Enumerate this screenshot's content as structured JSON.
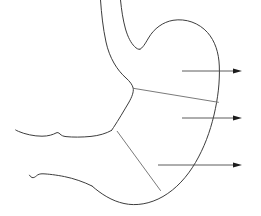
{
  "figure": {
    "background_color": "#ffffff",
    "outline_color": "#3d3d3d",
    "divider_color": "#6b6b6b",
    "arrow_color": "#1c1c1c",
    "width": 261,
    "height": 216
  },
  "outlines": [
    {
      "name": "esophagus-left-wall",
      "description": "left wall of esophagus descending into lesser curvature",
      "path": "M 100.5 0 C 101.5 14 103 28 106 42 C 109.5 58 117 70 126 78 C 130 81.5 132.5 85 133.2 88.2 C 133.8 92 132 97 128.5 103 C 124 110.5 118.5 120 113.5 127.5 C 112.8 128.6 112.2 129.6 111.6 130.4"
    },
    {
      "name": "esophagus-right-wall",
      "description": "right wall of esophagus ending at cardiac notch",
      "path": "M 120.5 0 C 121.5 10 123 20 125.5 29 C 128 37.5 131 43 134.5 46.5 C 136.5 48.5 138.5 49.8 140 49.2"
    },
    {
      "name": "fundus-and-greater-curvature",
      "description": "cardiac notch, fundus dome, greater curvature down to pylorus",
      "path": "M 140 49.2 C 142.5 48.2 145 44 148.5 38 C 154 28.5 163 22 173 20.3 C 186 18.2 199 23 207.5 32.5 C 215 41 218.8 52.5 219.3 66 C 219.9 82 218 98 214 115 C 210 132 204 148 195.5 162.5 C 187 177 176 189 163 196.5 C 150 204 136 206.2 124 203.5 C 112 201 101 194 92 186"
    },
    {
      "name": "duodenum-upper-wall",
      "description": "upper duodenal wall extending left from pylorus",
      "path": "M 111.6 130.4 C 106 133.5 99 135.6 91 136.4 C 82 137.3 72.5 137.3 66 136.6 C 63 136.3 61.5 135.4 60 134 C 58.5 132.6 57.5 132.2 56 133 C 53 134.6 48.5 136.2 42 136.2 C 34 136.2 25 134.2 18.5 131.4 C 17.3 130.9 16.4 130.4 15.7 130"
    },
    {
      "name": "duodenum-lower-wall",
      "description": "lower duodenal wall sweeping left then down to distal stomach",
      "path": "M 92 186 C 84 182 74 178.5 64.5 176.6 C 56 174.9 48 174 43 173.8 C 40 173.7 38 174.4 36.5 175.8 C 35 177.2 33.5 178 32 177.5 C 30.8 177.1 30 176.2 29.5 175.2"
    }
  ],
  "region_dividers": [
    {
      "name": "fundus-body-divider",
      "description": "line separating fundus from body along greater curvature",
      "path": "M 133.3 88.3 L 218.4 102.3"
    },
    {
      "name": "body-antrum-divider",
      "description": "line separating body from pyloric antrum",
      "path": "M 117.2 131.3 L 160.5 190.5"
    }
  ],
  "callouts": [
    {
      "name": "callout-fundus",
      "label": "",
      "line_y": 71,
      "line_x_start": 182,
      "line_x_end": 236,
      "arrow_tip_x": 242
    },
    {
      "name": "callout-body",
      "label": "",
      "line_y": 118,
      "line_x_start": 182,
      "line_x_end": 236,
      "arrow_tip_x": 242
    },
    {
      "name": "callout-antrum",
      "label": "",
      "line_y": 165,
      "line_x_start": 158,
      "line_x_end": 236,
      "arrow_tip_x": 242
    }
  ]
}
